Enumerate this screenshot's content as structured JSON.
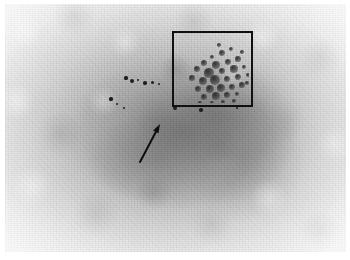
{
  "figure": {
    "title": "Radiographic grayscale image with region-of-interest annotation",
    "caption": "",
    "width": 350,
    "height": 260,
    "background_color": "#ffffff",
    "plate": {
      "x": 5,
      "y": 4,
      "width": 341,
      "height": 248,
      "base_tone": "#c6c6c6",
      "light_tone": "#e9e9e9",
      "dark_tone": "#8c8c8c",
      "description": "mottled light-gray parenchymal texture with a diffuse darker central mass"
    }
  },
  "annotations": {
    "roi_box": {
      "label": "",
      "x": 167,
      "y": 27,
      "width": 81,
      "height": 76,
      "stroke_color": "#101010",
      "stroke_width": 2,
      "fill": "none",
      "contains": "cluster of dark round microcalcifications"
    },
    "arrow": {
      "label": "",
      "tail_x": 135,
      "tail_y": 158,
      "tip_x": 155,
      "tip_y": 120,
      "stroke_color": "#0d0d0d",
      "stroke_width": 2,
      "head_length": 9,
      "head_width": 6,
      "points_to": "linear trail of small dark specks"
    },
    "calcification_cluster": {
      "count": 34,
      "color": "#2a2a2a",
      "spots": [
        {
          "cx": 46,
          "cy": 18,
          "r": 3.0
        },
        {
          "cx": 36,
          "cy": 22,
          "r": 2.2
        },
        {
          "cx": 55,
          "cy": 14,
          "r": 2.4
        },
        {
          "cx": 28,
          "cy": 28,
          "r": 3.4
        },
        {
          "cx": 40,
          "cy": 30,
          "r": 4.2
        },
        {
          "cx": 52,
          "cy": 27,
          "r": 3.0
        },
        {
          "cx": 62,
          "cy": 24,
          "r": 2.6
        },
        {
          "cx": 21,
          "cy": 34,
          "r": 2.8
        },
        {
          "cx": 33,
          "cy": 38,
          "r": 4.6
        },
        {
          "cx": 46,
          "cy": 36,
          "r": 3.2
        },
        {
          "cx": 58,
          "cy": 34,
          "r": 3.6
        },
        {
          "cx": 68,
          "cy": 32,
          "r": 2.4
        },
        {
          "cx": 16,
          "cy": 43,
          "r": 2.6
        },
        {
          "cx": 27,
          "cy": 46,
          "r": 4.0
        },
        {
          "cx": 39,
          "cy": 45,
          "r": 5.0
        },
        {
          "cx": 51,
          "cy": 44,
          "r": 3.4
        },
        {
          "cx": 62,
          "cy": 42,
          "r": 3.0
        },
        {
          "cx": 72,
          "cy": 40,
          "r": 2.2
        },
        {
          "cx": 22,
          "cy": 54,
          "r": 3.2
        },
        {
          "cx": 34,
          "cy": 54,
          "r": 4.4
        },
        {
          "cx": 45,
          "cy": 53,
          "r": 3.8
        },
        {
          "cx": 56,
          "cy": 52,
          "r": 3.0
        },
        {
          "cx": 66,
          "cy": 50,
          "r": 2.6
        },
        {
          "cx": 28,
          "cy": 62,
          "r": 3.0
        },
        {
          "cx": 40,
          "cy": 61,
          "r": 3.6
        },
        {
          "cx": 51,
          "cy": 60,
          "r": 2.8
        },
        {
          "cx": 61,
          "cy": 59,
          "r": 2.2
        },
        {
          "cx": 36,
          "cy": 68,
          "r": 2.4
        },
        {
          "cx": 47,
          "cy": 67,
          "r": 2.0
        },
        {
          "cx": 43,
          "cy": 10,
          "r": 1.8
        },
        {
          "cx": 66,
          "cy": 17,
          "r": 1.8
        },
        {
          "cx": 71,
          "cy": 48,
          "r": 1.8
        },
        {
          "cx": 24,
          "cy": 68,
          "r": 1.8
        },
        {
          "cx": 58,
          "cy": 66,
          "r": 1.8
        }
      ]
    },
    "satellite_specks": {
      "count": 12,
      "color": "#1e1e1e",
      "spots": [
        {
          "cx": 121,
          "cy": 74,
          "r": 1.6
        },
        {
          "cx": 127,
          "cy": 77,
          "r": 2.0
        },
        {
          "cx": 133,
          "cy": 76,
          "r": 1.4
        },
        {
          "cx": 140,
          "cy": 79,
          "r": 1.8
        },
        {
          "cx": 147,
          "cy": 78,
          "r": 1.5
        },
        {
          "cx": 154,
          "cy": 80,
          "r": 1.3
        },
        {
          "cx": 106,
          "cy": 95,
          "r": 1.6
        },
        {
          "cx": 112,
          "cy": 100,
          "r": 1.4
        },
        {
          "cx": 119,
          "cy": 104,
          "r": 1.2
        },
        {
          "cx": 170,
          "cy": 104,
          "r": 2.0
        },
        {
          "cx": 196,
          "cy": 106,
          "r": 1.8
        },
        {
          "cx": 232,
          "cy": 104,
          "r": 1.4
        }
      ]
    }
  }
}
